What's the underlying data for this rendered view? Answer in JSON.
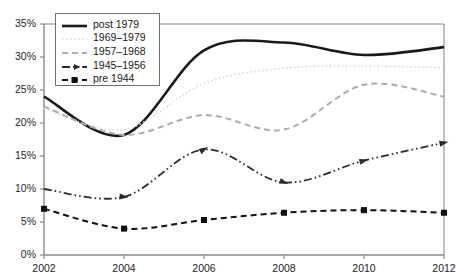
{
  "chart_data": {
    "type": "line",
    "title": "",
    "subtitle": "",
    "xlabel": "",
    "ylabel": "",
    "x": [
      2002,
      2004,
      2006,
      2008,
      2010,
      2012
    ],
    "xlim": [
      2002,
      2012
    ],
    "ylim": [
      0,
      35
    ],
    "ytick_labels": [
      "0%",
      "5%",
      "10%",
      "15%",
      "20%",
      "25%",
      "30%",
      "35%"
    ],
    "ytick_values": [
      0,
      5,
      10,
      15,
      20,
      25,
      30,
      35
    ],
    "xtick_labels": [
      "2002",
      "2004",
      "2006",
      "2008",
      "2010",
      "2012"
    ],
    "grid": false,
    "legend_position": "top-left",
    "series": [
      {
        "name": "post 1979",
        "values": [
          24.0,
          18.2,
          31.0,
          32.2,
          30.3,
          31.5
        ],
        "color": "#1a1a1a",
        "style": "solid",
        "width": 2.6,
        "marker": "none"
      },
      {
        "name": "1969–1979",
        "values": [
          22.2,
          19.0,
          26.0,
          28.3,
          28.6,
          28.4
        ],
        "color": "#d9d9d9",
        "style": "dotted",
        "width": 1.6,
        "marker": "none"
      },
      {
        "name": "1957–1968",
        "values": [
          22.5,
          18.2,
          21.2,
          19.0,
          25.8,
          24.0
        ],
        "color": "#adadad",
        "style": "dashed",
        "width": 2.0,
        "marker": "none"
      },
      {
        "name": "1945–1956",
        "values": [
          10.0,
          8.8,
          16.0,
          11.0,
          14.3,
          17.0
        ],
        "color": "#2b2b2b",
        "style": "dash-dot-dot",
        "width": 1.8,
        "marker": "arrow"
      },
      {
        "name": "pre 1944",
        "values": [
          7.0,
          4.0,
          5.3,
          6.4,
          6.8,
          6.4
        ],
        "color": "#111111",
        "style": "dashed",
        "width": 2.0,
        "marker": "square"
      }
    ]
  },
  "axes": {
    "frame_color": "#8a8a8a",
    "tick_color": "#8a8a8a"
  },
  "legend": {
    "entries": [
      {
        "label": "post 1979"
      },
      {
        "label": "1969–1979"
      },
      {
        "label": "1957–1968"
      },
      {
        "label": "1945–1956"
      },
      {
        "label": "pre 1944"
      }
    ]
  }
}
